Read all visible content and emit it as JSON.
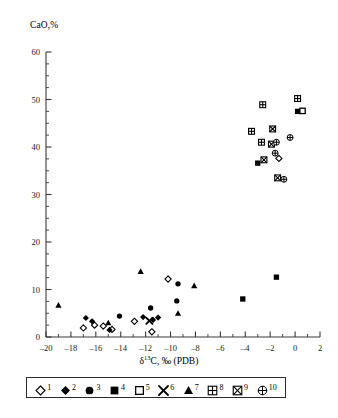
{
  "chart_data": {
    "type": "scatter",
    "title": "",
    "ylabel": "CaO,%",
    "xlabel": "δ13C, ‰ (PDB)",
    "xlabel_parts": {
      "delta": "δ",
      "sup": "13",
      "rest": "C, ‰ (PDB)"
    },
    "xlim": [
      -20,
      2
    ],
    "ylim": [
      0,
      60
    ],
    "x_ticks": [
      -20,
      -18,
      -16,
      -14,
      -12,
      -10,
      -8,
      -6,
      -4,
      -2,
      0,
      2
    ],
    "x_tick_labels": [
      "–20",
      "–18",
      "–16",
      "–14",
      "–12",
      "–10",
      "–8",
      "–6",
      "–4",
      "–2",
      "0",
      "2"
    ],
    "x_minor_step": 1,
    "y_ticks": [
      0,
      10,
      20,
      30,
      40,
      50,
      60
    ],
    "y_tick_labels": [
      "0",
      "10",
      "20",
      "30",
      "40",
      "50",
      "60"
    ],
    "y_minor_step": 2.5,
    "grid": false,
    "legend_position": "below-axes",
    "legend": [
      {
        "id": "1",
        "symbol": "open-diamond",
        "label": "1"
      },
      {
        "id": "2",
        "symbol": "filled-diamond",
        "label": "2"
      },
      {
        "id": "3",
        "symbol": "filled-circle",
        "label": "3"
      },
      {
        "id": "4",
        "symbol": "filled-square",
        "label": "4"
      },
      {
        "id": "5",
        "symbol": "open-square",
        "label": "5"
      },
      {
        "id": "6",
        "symbol": "cross-x",
        "label": "6"
      },
      {
        "id": "7",
        "symbol": "filled-triangle",
        "label": "7"
      },
      {
        "id": "8",
        "symbol": "square-plus",
        "label": "8"
      },
      {
        "id": "9",
        "symbol": "square-x",
        "label": "9"
      },
      {
        "id": "10",
        "symbol": "circle-plus",
        "label": "10"
      }
    ],
    "series": [
      {
        "name": "1",
        "symbol": "open-diamond",
        "points": [
          [
            -17.0,
            1.9
          ],
          [
            -16.1,
            2.5
          ],
          [
            -15.4,
            2.3
          ],
          [
            -14.7,
            1.6
          ],
          [
            -12.9,
            3.3
          ],
          [
            -11.5,
            1.1
          ],
          [
            -10.2,
            12.2
          ],
          [
            -1.3,
            37.6
          ]
        ]
      },
      {
        "name": "2",
        "symbol": "filled-diamond",
        "points": [
          [
            -16.8,
            4.0
          ],
          [
            -16.3,
            3.3
          ],
          [
            -14.9,
            1.5
          ],
          [
            -12.2,
            4.2
          ],
          [
            -11.4,
            3.6
          ],
          [
            -11.0,
            4.1
          ]
        ]
      },
      {
        "name": "3",
        "symbol": "filled-circle",
        "points": [
          [
            -14.1,
            4.4
          ],
          [
            -11.6,
            6.1
          ],
          [
            -9.5,
            7.6
          ],
          [
            -9.4,
            11.2
          ]
        ]
      },
      {
        "name": "4",
        "symbol": "filled-square",
        "points": [
          [
            -4.2,
            8.0
          ],
          [
            -1.5,
            12.6
          ],
          [
            -3.0,
            36.6
          ],
          [
            0.2,
            47.5
          ]
        ]
      },
      {
        "name": "5",
        "symbol": "open-square",
        "points": [
          [
            0.6,
            47.6
          ]
        ]
      },
      {
        "name": "6",
        "symbol": "cross-x",
        "points": [
          [
            -11.7,
            3.4
          ]
        ]
      },
      {
        "name": "7",
        "symbol": "filled-triangle",
        "points": [
          [
            -19.0,
            6.7
          ],
          [
            -15.0,
            3.0
          ],
          [
            -12.4,
            13.8
          ],
          [
            -9.4,
            5.0
          ],
          [
            -8.1,
            10.8
          ]
        ]
      },
      {
        "name": "8",
        "symbol": "square-plus",
        "points": [
          [
            -2.6,
            48.9
          ],
          [
            0.2,
            50.2
          ],
          [
            -3.5,
            43.3
          ],
          [
            -2.7,
            41.0
          ]
        ]
      },
      {
        "name": "9",
        "symbol": "square-x",
        "points": [
          [
            -1.8,
            43.8
          ],
          [
            -1.9,
            40.6
          ],
          [
            -2.5,
            37.3
          ],
          [
            -1.4,
            33.5
          ]
        ]
      },
      {
        "name": "10",
        "symbol": "circle-plus",
        "points": [
          [
            -0.4,
            42.0
          ],
          [
            -1.5,
            41.0
          ],
          [
            -1.6,
            38.7
          ],
          [
            -0.9,
            33.2
          ]
        ]
      }
    ]
  }
}
